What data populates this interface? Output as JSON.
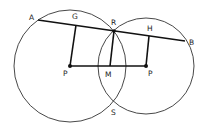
{
  "diagram": {
    "colors": {
      "stroke": "#333333",
      "line": "#111111",
      "background": "#ffffff"
    },
    "circles": [
      {
        "id": "left-circle",
        "center": "P",
        "cx": 70,
        "cy": 66,
        "r": 56
      },
      {
        "id": "right-circle",
        "center": "P",
        "cx": 146,
        "cy": 66,
        "r": 48
      }
    ],
    "points": {
      "A": {
        "label": "A",
        "x": 38,
        "y": 20
      },
      "G": {
        "label": "G",
        "x": 76,
        "y": 25
      },
      "R": {
        "label": "R",
        "x": 114,
        "y": 31
      },
      "H": {
        "label": "H",
        "x": 149,
        "y": 36
      },
      "B": {
        "label": "B",
        "x": 185,
        "y": 41
      },
      "P1": {
        "label": "P",
        "x": 70,
        "y": 66
      },
      "M": {
        "label": "M",
        "x": 110,
        "y": 66
      },
      "P2": {
        "label": "P",
        "x": 146,
        "y": 66
      },
      "S": {
        "label": "S",
        "x": 114,
        "y": 102
      }
    },
    "segments": [
      [
        "A",
        "B"
      ],
      [
        "G",
        "P1"
      ],
      [
        "H",
        "P2"
      ],
      [
        "P1",
        "P2"
      ],
      [
        "R",
        "M"
      ]
    ],
    "labels": {
      "A": "A",
      "G": "G",
      "R": "R",
      "H": "H",
      "B": "B",
      "P1": "P",
      "M": "M",
      "P2": "P",
      "S": "S"
    }
  }
}
